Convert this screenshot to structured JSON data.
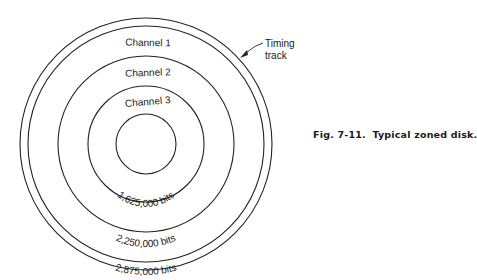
{
  "figure": {
    "number": "Fig. 7-11.",
    "title": "Typical zoned disk."
  },
  "disk": {
    "center": [
      146,
      144
    ],
    "rings": [
      {
        "name": "outer-edge",
        "radius": 126
      },
      {
        "name": "timing-track-inner",
        "radius": 118
      },
      {
        "name": "channel-1-2-boundary",
        "radius": 88
      },
      {
        "name": "channel-2-3-boundary",
        "radius": 58
      },
      {
        "name": "hub",
        "radius": 30
      }
    ],
    "stroke_color": "#222222"
  },
  "labels": {
    "channel_1": "Channel 1",
    "channel_2": "Channel 2",
    "channel_3": "Channel 3",
    "bits_3": "1,625,000 bits",
    "bits_2": "2,250,000 bits",
    "bits_1": "2,875,000 bits",
    "timing_line1": "Timing",
    "timing_line2": "track"
  }
}
